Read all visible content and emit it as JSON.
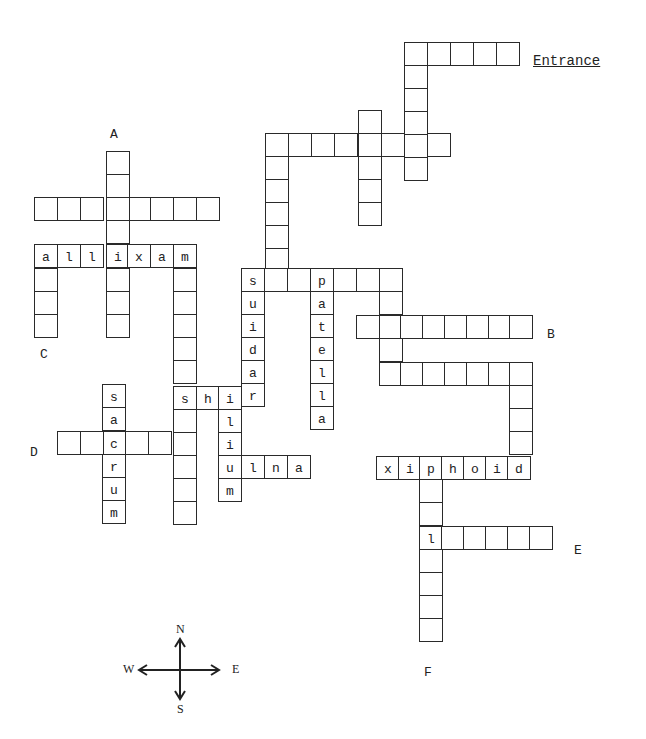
{
  "puzzle": {
    "type": "bone-crossword-maze",
    "entrance_label": "Entrance",
    "cell_size": 23,
    "origin_x": 34,
    "origin_y": 42,
    "markers": [
      {
        "id": "A",
        "text": "A",
        "x": 110,
        "y": 127
      },
      {
        "id": "B",
        "text": "B",
        "x": 547,
        "y": 327
      },
      {
        "id": "C",
        "text": "C",
        "x": 40,
        "y": 347
      },
      {
        "id": "D",
        "text": "D",
        "x": 30,
        "y": 445
      },
      {
        "id": "E",
        "text": "E",
        "x": 574,
        "y": 543
      },
      {
        "id": "F",
        "text": "F",
        "x": 424,
        "y": 665
      }
    ],
    "cells": [
      {
        "x": 404,
        "y": 42,
        "l": ""
      },
      {
        "x": 427,
        "y": 42,
        "l": ""
      },
      {
        "x": 450,
        "y": 42,
        "l": ""
      },
      {
        "x": 473,
        "y": 42,
        "l": ""
      },
      {
        "x": 496,
        "y": 42,
        "l": ""
      },
      {
        "x": 404,
        "y": 65,
        "l": ""
      },
      {
        "x": 404,
        "y": 88,
        "l": ""
      },
      {
        "x": 404,
        "y": 111,
        "l": ""
      },
      {
        "x": 404,
        "y": 134,
        "l": ""
      },
      {
        "x": 404,
        "y": 157,
        "l": ""
      },
      {
        "x": 265,
        "y": 133,
        "l": ""
      },
      {
        "x": 288,
        "y": 133,
        "l": ""
      },
      {
        "x": 311,
        "y": 133,
        "l": ""
      },
      {
        "x": 334,
        "y": 133,
        "l": ""
      },
      {
        "x": 358,
        "y": 133,
        "l": ""
      },
      {
        "x": 381,
        "y": 133,
        "l": ""
      },
      {
        "x": 427,
        "y": 133,
        "l": ""
      },
      {
        "x": 358,
        "y": 110,
        "l": ""
      },
      {
        "x": 358,
        "y": 156,
        "l": ""
      },
      {
        "x": 358,
        "y": 179,
        "l": ""
      },
      {
        "x": 358,
        "y": 202,
        "l": ""
      },
      {
        "x": 265,
        "y": 156,
        "l": ""
      },
      {
        "x": 265,
        "y": 179,
        "l": ""
      },
      {
        "x": 265,
        "y": 202,
        "l": ""
      },
      {
        "x": 265,
        "y": 225,
        "l": ""
      },
      {
        "x": 265,
        "y": 248,
        "l": ""
      },
      {
        "x": 106,
        "y": 151,
        "l": ""
      },
      {
        "x": 106,
        "y": 174,
        "l": ""
      },
      {
        "x": 34,
        "y": 197,
        "l": ""
      },
      {
        "x": 57,
        "y": 197,
        "l": ""
      },
      {
        "x": 80,
        "y": 197,
        "l": ""
      },
      {
        "x": 106,
        "y": 197,
        "l": ""
      },
      {
        "x": 129,
        "y": 197,
        "l": ""
      },
      {
        "x": 150,
        "y": 197,
        "l": ""
      },
      {
        "x": 173,
        "y": 197,
        "l": ""
      },
      {
        "x": 196,
        "y": 197,
        "l": ""
      },
      {
        "x": 106,
        "y": 220,
        "l": ""
      },
      {
        "x": 34,
        "y": 244,
        "l": "a"
      },
      {
        "x": 57,
        "y": 244,
        "l": "l"
      },
      {
        "x": 80,
        "y": 244,
        "l": "l"
      },
      {
        "x": 106,
        "y": 244,
        "l": "i"
      },
      {
        "x": 127,
        "y": 244,
        "l": "x"
      },
      {
        "x": 150,
        "y": 244,
        "l": "a"
      },
      {
        "x": 173,
        "y": 244,
        "l": "m"
      },
      {
        "x": 34,
        "y": 268,
        "l": ""
      },
      {
        "x": 34,
        "y": 291,
        "l": ""
      },
      {
        "x": 34,
        "y": 314,
        "l": ""
      },
      {
        "x": 106,
        "y": 268,
        "l": ""
      },
      {
        "x": 106,
        "y": 291,
        "l": ""
      },
      {
        "x": 106,
        "y": 314,
        "l": ""
      },
      {
        "x": 173,
        "y": 268,
        "l": ""
      },
      {
        "x": 173,
        "y": 291,
        "l": ""
      },
      {
        "x": 173,
        "y": 314,
        "l": ""
      },
      {
        "x": 173,
        "y": 337,
        "l": ""
      },
      {
        "x": 173,
        "y": 360,
        "l": ""
      },
      {
        "x": 241,
        "y": 268,
        "l": ""
      },
      {
        "x": 264,
        "y": 268,
        "l": ""
      },
      {
        "x": 287,
        "y": 268,
        "l": ""
      },
      {
        "x": 310,
        "y": 268,
        "l": "p"
      },
      {
        "x": 333,
        "y": 268,
        "l": ""
      },
      {
        "x": 356,
        "y": 268,
        "l": ""
      },
      {
        "x": 379,
        "y": 268,
        "l": ""
      },
      {
        "x": 241,
        "y": 268,
        "l": "s"
      },
      {
        "x": 241,
        "y": 291,
        "l": "u"
      },
      {
        "x": 241,
        "y": 314,
        "l": "i"
      },
      {
        "x": 241,
        "y": 337,
        "l": "d"
      },
      {
        "x": 241,
        "y": 360,
        "l": "a"
      },
      {
        "x": 241,
        "y": 383,
        "l": "r"
      },
      {
        "x": 310,
        "y": 291,
        "l": "a"
      },
      {
        "x": 310,
        "y": 314,
        "l": "t"
      },
      {
        "x": 310,
        "y": 337,
        "l": "e"
      },
      {
        "x": 310,
        "y": 360,
        "l": "l"
      },
      {
        "x": 310,
        "y": 383,
        "l": "l"
      },
      {
        "x": 310,
        "y": 406,
        "l": "a"
      },
      {
        "x": 379,
        "y": 291,
        "l": ""
      },
      {
        "x": 356,
        "y": 315,
        "l": ""
      },
      {
        "x": 379,
        "y": 315,
        "l": ""
      },
      {
        "x": 400,
        "y": 315,
        "l": ""
      },
      {
        "x": 422,
        "y": 315,
        "l": ""
      },
      {
        "x": 444,
        "y": 315,
        "l": ""
      },
      {
        "x": 466,
        "y": 315,
        "l": ""
      },
      {
        "x": 488,
        "y": 315,
        "l": ""
      },
      {
        "x": 509,
        "y": 315,
        "l": ""
      },
      {
        "x": 379,
        "y": 338,
        "l": ""
      },
      {
        "x": 379,
        "y": 362,
        "l": ""
      },
      {
        "x": 400,
        "y": 362,
        "l": ""
      },
      {
        "x": 422,
        "y": 362,
        "l": ""
      },
      {
        "x": 444,
        "y": 362,
        "l": ""
      },
      {
        "x": 466,
        "y": 362,
        "l": ""
      },
      {
        "x": 488,
        "y": 362,
        "l": ""
      },
      {
        "x": 509,
        "y": 362,
        "l": ""
      },
      {
        "x": 509,
        "y": 385,
        "l": ""
      },
      {
        "x": 509,
        "y": 408,
        "l": ""
      },
      {
        "x": 509,
        "y": 431,
        "l": ""
      },
      {
        "x": 376,
        "y": 456,
        "l": "x"
      },
      {
        "x": 398,
        "y": 456,
        "l": "i"
      },
      {
        "x": 419,
        "y": 456,
        "l": "p"
      },
      {
        "x": 441,
        "y": 456,
        "l": "h"
      },
      {
        "x": 463,
        "y": 456,
        "l": "o"
      },
      {
        "x": 485,
        "y": 456,
        "l": "i"
      },
      {
        "x": 507,
        "y": 456,
        "l": "d"
      },
      {
        "x": 419,
        "y": 479,
        "l": ""
      },
      {
        "x": 419,
        "y": 502,
        "l": ""
      },
      {
        "x": 419,
        "y": 526,
        "l": "l"
      },
      {
        "x": 441,
        "y": 526,
        "l": ""
      },
      {
        "x": 463,
        "y": 526,
        "l": ""
      },
      {
        "x": 485,
        "y": 526,
        "l": ""
      },
      {
        "x": 507,
        "y": 526,
        "l": ""
      },
      {
        "x": 529,
        "y": 526,
        "l": ""
      },
      {
        "x": 419,
        "y": 549,
        "l": ""
      },
      {
        "x": 419,
        "y": 572,
        "l": ""
      },
      {
        "x": 419,
        "y": 595,
        "l": ""
      },
      {
        "x": 419,
        "y": 618,
        "l": ""
      },
      {
        "x": 173,
        "y": 386,
        "l": "s"
      },
      {
        "x": 196,
        "y": 386,
        "l": "h"
      },
      {
        "x": 218,
        "y": 386,
        "l": "i"
      },
      {
        "x": 173,
        "y": 409,
        "l": ""
      },
      {
        "x": 173,
        "y": 432,
        "l": ""
      },
      {
        "x": 173,
        "y": 455,
        "l": ""
      },
      {
        "x": 173,
        "y": 478,
        "l": ""
      },
      {
        "x": 173,
        "y": 501,
        "l": ""
      },
      {
        "x": 218,
        "y": 409,
        "l": "l"
      },
      {
        "x": 218,
        "y": 432,
        "l": "i"
      },
      {
        "x": 218,
        "y": 455,
        "l": "u"
      },
      {
        "x": 218,
        "y": 478,
        "l": "m"
      },
      {
        "x": 241,
        "y": 455,
        "l": "l"
      },
      {
        "x": 264,
        "y": 455,
        "l": "n"
      },
      {
        "x": 287,
        "y": 455,
        "l": "a"
      },
      {
        "x": 102,
        "y": 384,
        "l": "s"
      },
      {
        "x": 102,
        "y": 407,
        "l": "a"
      },
      {
        "x": 102,
        "y": 431,
        "l": "c"
      },
      {
        "x": 102,
        "y": 454,
        "l": "r"
      },
      {
        "x": 102,
        "y": 477,
        "l": "u"
      },
      {
        "x": 102,
        "y": 500,
        "l": "m"
      },
      {
        "x": 57,
        "y": 431,
        "l": ""
      },
      {
        "x": 80,
        "y": 431,
        "l": ""
      },
      {
        "x": 125,
        "y": 431,
        "l": ""
      },
      {
        "x": 148,
        "y": 431,
        "l": ""
      }
    ],
    "filled_words": [
      "maxilla",
      "radius",
      "patella",
      "ribs",
      "ilium",
      "ulna",
      "sacrum",
      "xiphoid"
    ]
  },
  "compass": {
    "n": "N",
    "s": "S",
    "e": "E",
    "w": "W"
  }
}
